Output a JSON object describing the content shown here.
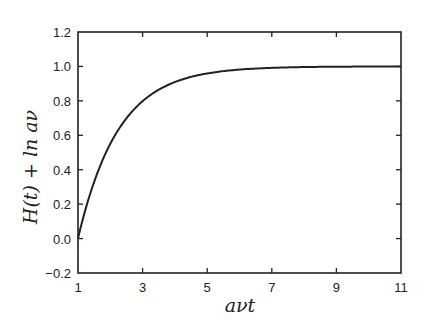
{
  "chart_data": {
    "type": "line",
    "title": "",
    "xlabel": "aνt",
    "ylabel": "H(t) + ln aν",
    "xlim": [
      1,
      11
    ],
    "ylim": [
      -0.2,
      1.2
    ],
    "xticks": [
      1,
      3,
      5,
      7,
      9,
      11
    ],
    "yticks": [
      -0.2,
      0.0,
      0.2,
      0.4,
      0.6,
      0.8,
      1.0,
      1.2
    ],
    "ytick_labels": [
      "−0.2",
      "0.0",
      "0.2",
      "0.4",
      "0.6",
      "0.8",
      "1.0",
      "1.2"
    ],
    "grid": false,
    "legend": null,
    "series": [
      {
        "name": "H(t) + ln aν",
        "color": "#222222",
        "x": [
          1,
          1.5,
          2,
          2.5,
          3,
          3.5,
          4,
          4.5,
          5,
          5.5,
          6,
          7,
          8,
          9,
          10,
          11
        ],
        "y": [
          0.0,
          0.33,
          0.55,
          0.7,
          0.8,
          0.86,
          0.91,
          0.94,
          0.96,
          0.97,
          0.98,
          0.99,
          1.0,
          1.0,
          1.0,
          1.0
        ]
      }
    ]
  },
  "plot": {
    "left": 78,
    "right": 401,
    "top": 32,
    "bottom": 273,
    "line_color": "#222222",
    "axis_color": "#222222"
  }
}
